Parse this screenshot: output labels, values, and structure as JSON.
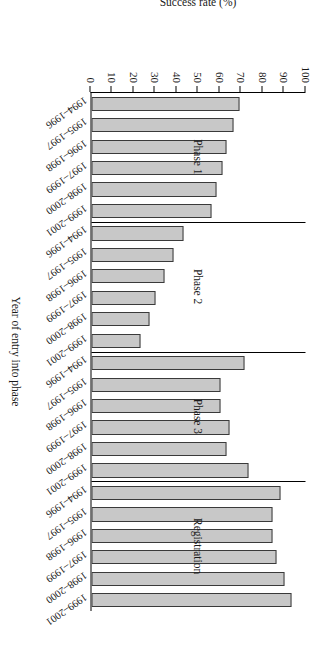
{
  "chart_data": {
    "type": "bar",
    "title": "",
    "xlabel": "Year of entry into phase",
    "ylabel": "Success rate (%)",
    "ylim": [
      0,
      100
    ],
    "yticks": [
      100,
      90,
      80,
      70,
      60,
      50,
      40,
      30,
      20,
      10,
      0
    ],
    "grid": false,
    "legend": null,
    "orientation": "vertical",
    "bar_color": "#c8c8c8",
    "bar_edge_color": "#3a3a3a",
    "categories": [
      "1994-1996",
      "1995-1997",
      "1996-1998",
      "1997-1999",
      "1998-2000",
      "1999-2001"
    ],
    "groups": [
      {
        "name": "Phase 1",
        "categories": [
          "1994-1996",
          "1995-1997",
          "1996-1998",
          "1997-1999",
          "1998-2000",
          "1999-2001"
        ],
        "values": [
          69,
          66,
          63,
          61,
          58,
          56
        ]
      },
      {
        "name": "Phase 2",
        "categories": [
          "1994-1996",
          "1995-1997",
          "1996-1998",
          "1997-1999",
          "1998-2000",
          "1999-2001"
        ],
        "values": [
          43,
          38,
          34,
          30,
          27,
          23
        ]
      },
      {
        "name": "Phase 3",
        "categories": [
          "1994-1996",
          "1995-1997",
          "1996-1998",
          "1997-1999",
          "1998-2000",
          "1999-2001"
        ],
        "values": [
          71,
          60,
          60,
          64,
          63,
          73
        ]
      },
      {
        "name": "Registration",
        "categories": [
          "1994-1996",
          "1995-1997",
          "1996-1998",
          "1997-1999",
          "1998-2000",
          "1999-2001"
        ],
        "values": [
          88,
          84,
          84,
          86,
          90,
          93
        ]
      }
    ]
  }
}
